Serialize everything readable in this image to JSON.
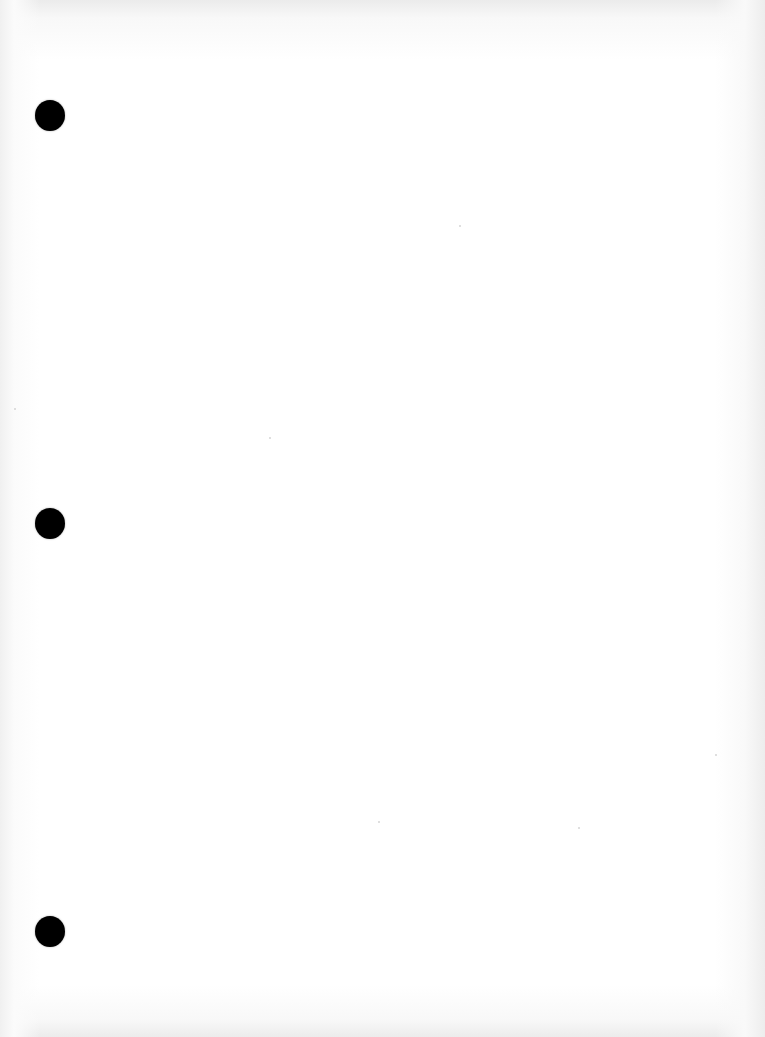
{
  "page": {
    "type": "blank scanned three-hole-punched sheet",
    "background_color": "#ffffff",
    "edge_shading_color": "#ebebeb",
    "text_content": ""
  },
  "punch_holes": [
    {
      "label": "top-hole",
      "center_x": 50,
      "center_y": 116,
      "diameter": 30,
      "color": "#000000"
    },
    {
      "label": "middle-hole",
      "center_x": 50,
      "center_y": 523,
      "diameter": 30,
      "color": "#000000"
    },
    {
      "label": "bottom-hole",
      "center_x": 50,
      "center_y": 932,
      "diameter": 30,
      "color": "#000000"
    }
  ]
}
